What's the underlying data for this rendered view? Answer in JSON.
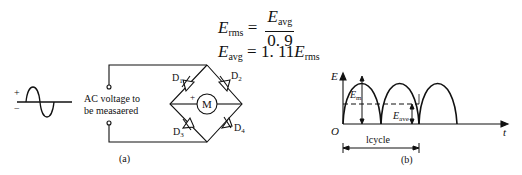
{
  "equations": {
    "eq1": {
      "lhs_symbol": "E",
      "lhs_sub": "rms",
      "equals": "=",
      "num_symbol": "E",
      "num_sub": "avg",
      "denominator": "0. 9"
    },
    "eq2": {
      "lhs_symbol": "E",
      "lhs_sub": "avg",
      "equals": "= 1. 11",
      "rhs_symbol": "E",
      "rhs_sub": "rms"
    }
  },
  "diagram_a": {
    "plus_sign": "+",
    "minus_sign": "−",
    "source_label_line1": "AC  voltage to",
    "source_label_line2": "be measaered",
    "diodes": [
      "D",
      "D",
      "D",
      "D"
    ],
    "diode_subs": [
      "1",
      "2",
      "3",
      "4"
    ],
    "meter_label": "M",
    "meter_plus": "+",
    "caption": "(a)"
  },
  "diagram_b": {
    "y_axis_label": "E",
    "x_axis_label": "t",
    "origin_label": "O",
    "peak_label_symbol": "E",
    "peak_label_sub": "m",
    "avg_label_symbol": "E",
    "avg_label_sub": "ave",
    "cycle_label": "lcycle",
    "caption": "(b)"
  }
}
